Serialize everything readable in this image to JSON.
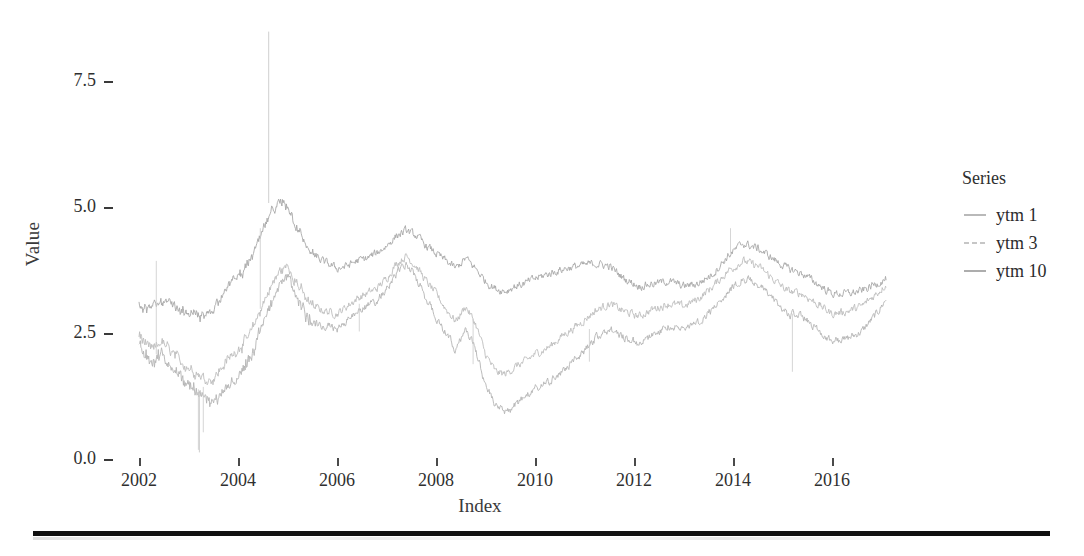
{
  "chart_data": {
    "type": "line",
    "title": "",
    "xlabel": "Index",
    "ylabel": "Value",
    "xlim": [
      2001.8,
      2017.2
    ],
    "ylim": [
      0.0,
      8.6
    ],
    "grid": false,
    "legend_position": "right",
    "legend_title": "Series",
    "xticks": [
      2002,
      2004,
      2006,
      2008,
      2010,
      2012,
      2014,
      2016
    ],
    "xtick_labels": [
      "2002",
      "2004",
      "2006",
      "2008",
      "2010",
      "2012",
      "2014",
      "2016"
    ],
    "yticks": [
      0.0,
      2.5,
      5.0,
      7.5
    ],
    "ytick_labels": [
      "0.0",
      "2.5",
      "5.0",
      "7.5"
    ],
    "series": [
      {
        "name": "ytm 1",
        "color": "#b4b4b4",
        "x": [
          2002.0,
          2002.15,
          2002.3,
          2002.45,
          2002.6,
          2002.75,
          2002.9,
          2003.05,
          2003.2,
          2003.35,
          2003.5,
          2003.65,
          2003.8,
          2003.95,
          2004.1,
          2004.25,
          2004.4,
          2004.55,
          2004.7,
          2004.85,
          2005.0,
          2005.2,
          2005.4,
          2005.6,
          2005.8,
          2006.0,
          2006.2,
          2006.4,
          2006.6,
          2006.8,
          2007.0,
          2007.2,
          2007.4,
          2007.6,
          2007.8,
          2008.0,
          2008.2,
          2008.4,
          2008.6,
          2008.8,
          2009.0,
          2009.2,
          2009.4,
          2009.6,
          2009.8,
          2010.0,
          2010.3,
          2010.6,
          2010.9,
          2011.2,
          2011.5,
          2011.8,
          2012.1,
          2012.4,
          2012.7,
          2013.0,
          2013.3,
          2013.6,
          2013.9,
          2014.2,
          2014.5,
          2014.8,
          2015.1,
          2015.4,
          2015.7,
          2016.0,
          2016.3,
          2016.6,
          2016.9,
          2017.1
        ],
        "y": [
          2.35,
          2.05,
          1.95,
          2.1,
          1.9,
          1.75,
          1.6,
          1.5,
          1.35,
          1.2,
          1.15,
          1.3,
          1.45,
          1.6,
          1.75,
          2.0,
          2.4,
          2.8,
          3.2,
          3.5,
          3.6,
          3.2,
          2.85,
          2.7,
          2.65,
          2.6,
          2.75,
          2.95,
          3.05,
          3.15,
          3.4,
          3.7,
          3.9,
          3.6,
          3.2,
          2.85,
          2.5,
          2.2,
          2.6,
          2.2,
          1.5,
          1.05,
          0.95,
          1.1,
          1.25,
          1.4,
          1.55,
          1.8,
          2.05,
          2.4,
          2.6,
          2.45,
          2.3,
          2.5,
          2.65,
          2.6,
          2.75,
          3.0,
          3.35,
          3.6,
          3.5,
          3.2,
          2.9,
          2.85,
          2.6,
          2.35,
          2.4,
          2.55,
          2.9,
          3.2
        ]
      },
      {
        "name": "ytm 3",
        "color": "#bdbdbd",
        "x": [
          2002.0,
          2002.15,
          2002.3,
          2002.45,
          2002.6,
          2002.75,
          2002.9,
          2003.05,
          2003.2,
          2003.35,
          2003.5,
          2003.65,
          2003.8,
          2003.95,
          2004.1,
          2004.25,
          2004.4,
          2004.55,
          2004.7,
          2004.85,
          2005.0,
          2005.2,
          2005.4,
          2005.6,
          2005.8,
          2006.0,
          2006.2,
          2006.4,
          2006.6,
          2006.8,
          2007.0,
          2007.2,
          2007.4,
          2007.6,
          2007.8,
          2008.0,
          2008.2,
          2008.4,
          2008.6,
          2008.8,
          2009.0,
          2009.2,
          2009.4,
          2009.6,
          2009.8,
          2010.0,
          2010.3,
          2010.6,
          2010.9,
          2011.2,
          2011.5,
          2011.8,
          2012.1,
          2012.4,
          2012.7,
          2013.0,
          2013.3,
          2013.6,
          2013.9,
          2014.2,
          2014.5,
          2014.8,
          2015.1,
          2015.4,
          2015.7,
          2016.0,
          2016.3,
          2016.6,
          2016.9,
          2017.1
        ],
        "y": [
          2.5,
          2.25,
          2.2,
          2.35,
          2.2,
          2.05,
          1.9,
          1.8,
          1.7,
          1.6,
          1.6,
          1.8,
          2.0,
          2.15,
          2.3,
          2.5,
          2.85,
          3.2,
          3.5,
          3.75,
          3.85,
          3.5,
          3.15,
          3.0,
          2.95,
          2.9,
          3.05,
          3.2,
          3.3,
          3.4,
          3.6,
          3.9,
          4.05,
          3.85,
          3.55,
          3.3,
          3.0,
          2.75,
          3.05,
          2.7,
          2.1,
          1.75,
          1.7,
          1.85,
          1.95,
          2.1,
          2.25,
          2.5,
          2.7,
          2.95,
          3.1,
          2.95,
          2.85,
          3.0,
          3.1,
          3.05,
          3.2,
          3.45,
          3.75,
          3.95,
          3.85,
          3.6,
          3.35,
          3.3,
          3.1,
          2.9,
          2.95,
          3.05,
          3.3,
          3.5
        ]
      },
      {
        "name": "ytm 10",
        "color": "#a8a8a8",
        "x": [
          2002.0,
          2002.15,
          2002.3,
          2002.45,
          2002.6,
          2002.75,
          2002.9,
          2003.05,
          2003.2,
          2003.35,
          2003.5,
          2003.65,
          2003.8,
          2003.95,
          2004.1,
          2004.25,
          2004.4,
          2004.55,
          2004.7,
          2004.85,
          2005.0,
          2005.2,
          2005.4,
          2005.6,
          2005.8,
          2006.0,
          2006.2,
          2006.4,
          2006.6,
          2006.8,
          2007.0,
          2007.2,
          2007.4,
          2007.6,
          2007.8,
          2008.0,
          2008.2,
          2008.4,
          2008.6,
          2008.8,
          2009.0,
          2009.2,
          2009.4,
          2009.6,
          2009.8,
          2010.0,
          2010.3,
          2010.6,
          2010.9,
          2011.2,
          2011.5,
          2011.8,
          2012.1,
          2012.4,
          2012.7,
          2013.0,
          2013.3,
          2013.6,
          2013.9,
          2014.2,
          2014.5,
          2014.8,
          2015.1,
          2015.4,
          2015.7,
          2016.0,
          2016.3,
          2016.6,
          2016.9,
          2017.1
        ],
        "y": [
          3.1,
          3.0,
          3.05,
          3.15,
          3.1,
          3.0,
          2.95,
          2.9,
          2.85,
          2.85,
          3.0,
          3.25,
          3.45,
          3.6,
          3.75,
          3.95,
          4.3,
          4.65,
          4.95,
          5.1,
          5.05,
          4.6,
          4.2,
          4.0,
          3.9,
          3.8,
          3.85,
          3.95,
          4.0,
          4.1,
          4.25,
          4.45,
          4.55,
          4.45,
          4.25,
          4.1,
          3.95,
          3.8,
          4.0,
          3.8,
          3.55,
          3.4,
          3.35,
          3.45,
          3.5,
          3.6,
          3.7,
          3.8,
          3.85,
          3.9,
          3.85,
          3.6,
          3.45,
          3.5,
          3.55,
          3.45,
          3.5,
          3.7,
          4.05,
          4.3,
          4.2,
          4.0,
          3.8,
          3.7,
          3.5,
          3.3,
          3.3,
          3.35,
          3.5,
          3.6
        ]
      }
    ],
    "annotations": [
      {
        "label": "upward outlier spike",
        "x": 2004.62,
        "y": 8.5
      },
      {
        "label": "downward outlier spike",
        "x": 2003.22,
        "y": 0.15
      }
    ]
  },
  "axes": {
    "y_title": "Value",
    "x_title": "Index",
    "ytick_labels": [
      "7.5",
      "5.0",
      "2.5",
      "0.0"
    ],
    "xtick_labels": [
      "2002",
      "2004",
      "2006",
      "2008",
      "2010",
      "2012",
      "2014",
      "2016"
    ]
  },
  "legend": {
    "title": "Series",
    "items": [
      {
        "label": "ytm 1",
        "color": "#b4b4b4",
        "dash": "solid"
      },
      {
        "label": "ytm 3",
        "color": "#c4c4c4",
        "dash": "dashed"
      },
      {
        "label": "ytm 10",
        "color": "#a8a8a8",
        "dash": "solid"
      }
    ]
  }
}
